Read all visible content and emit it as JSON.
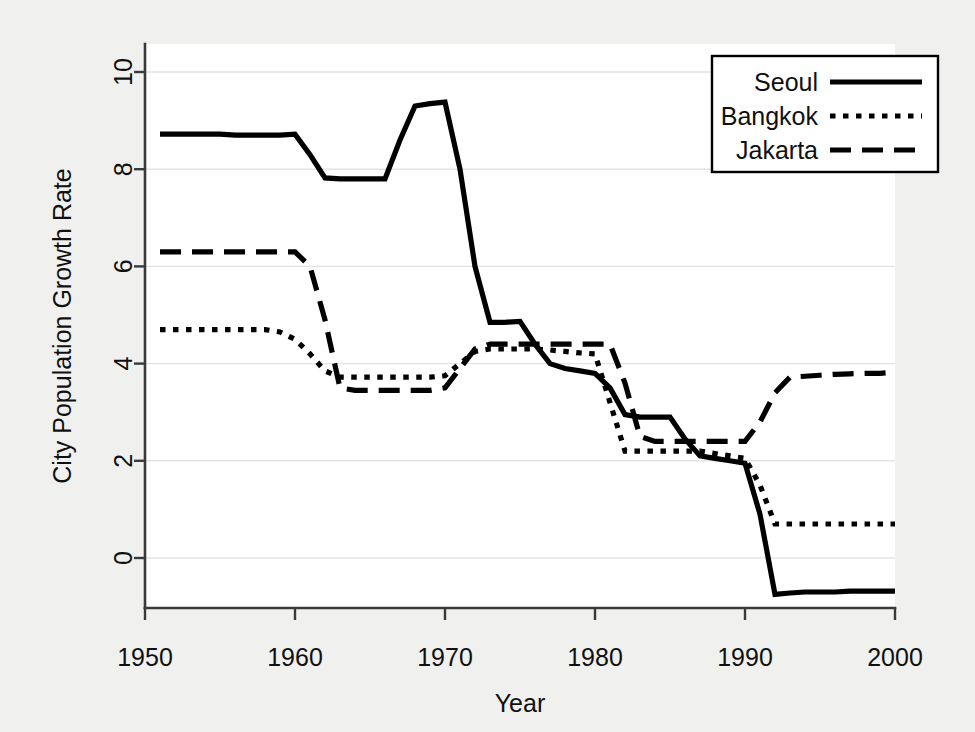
{
  "chart_data": {
    "type": "line",
    "title": "",
    "xlabel": "Year",
    "ylabel": "City Population Growth Rate",
    "xlim": [
      1950,
      2000
    ],
    "ylim": [
      -1.1,
      10.4
    ],
    "xticks": [
      1950,
      1960,
      1970,
      1980,
      1990,
      2000
    ],
    "xtick_labels": [
      "1950",
      "1960",
      "1970",
      "1980",
      "1990",
      "2000"
    ],
    "yticks": [
      0,
      2,
      4,
      6,
      8,
      10
    ],
    "ytick_labels": [
      "0",
      "2",
      "4",
      "6",
      "8",
      "10"
    ],
    "grid": "horizontal",
    "legend_position": "top-right",
    "legend_entries": [
      "Seoul",
      "Bangkok",
      "Jakarta"
    ],
    "x": [
      1951,
      1952,
      1953,
      1954,
      1955,
      1956,
      1957,
      1958,
      1959,
      1960,
      1961,
      1962,
      1963,
      1964,
      1965,
      1966,
      1967,
      1968,
      1969,
      1970,
      1971,
      1972,
      1973,
      1974,
      1975,
      1976,
      1977,
      1978,
      1979,
      1980,
      1981,
      1982,
      1983,
      1984,
      1985,
      1986,
      1987,
      1988,
      1989,
      1990,
      1991,
      1992,
      1993,
      1994,
      1995,
      1996,
      1997,
      1998,
      1999,
      2000
    ],
    "series": [
      {
        "name": "Seoul",
        "style": "solid",
        "values": [
          8.72,
          8.72,
          8.72,
          8.72,
          8.72,
          8.7,
          8.7,
          8.7,
          8.7,
          8.72,
          8.3,
          7.82,
          7.8,
          7.8,
          7.8,
          7.8,
          8.6,
          9.3,
          9.35,
          9.38,
          8.0,
          6.0,
          4.85,
          4.85,
          4.87,
          4.4,
          4.0,
          3.9,
          3.85,
          3.8,
          3.5,
          2.95,
          2.9,
          2.9,
          2.9,
          2.45,
          2.1,
          2.05,
          2.0,
          1.95,
          0.9,
          -0.75,
          -0.72,
          -0.7,
          -0.7,
          -0.7,
          -0.68,
          -0.68,
          -0.68,
          -0.68
        ]
      },
      {
        "name": "Bangkok",
        "style": "dotted",
        "values": [
          4.7,
          4.7,
          4.7,
          4.7,
          4.7,
          4.7,
          4.7,
          4.7,
          4.65,
          4.5,
          4.2,
          3.85,
          3.72,
          3.72,
          3.72,
          3.72,
          3.72,
          3.72,
          3.72,
          3.75,
          4.0,
          4.25,
          4.3,
          4.3,
          4.3,
          4.3,
          4.28,
          4.25,
          4.22,
          4.2,
          3.2,
          2.2,
          2.2,
          2.2,
          2.2,
          2.2,
          2.2,
          2.15,
          2.1,
          2.05,
          1.5,
          0.7,
          0.7,
          0.7,
          0.7,
          0.7,
          0.7,
          0.7,
          0.7,
          0.7
        ]
      },
      {
        "name": "Jakarta",
        "style": "dashed",
        "values": [
          6.3,
          6.3,
          6.3,
          6.3,
          6.3,
          6.3,
          6.3,
          6.3,
          6.3,
          6.3,
          6.0,
          4.9,
          3.5,
          3.45,
          3.45,
          3.45,
          3.45,
          3.45,
          3.45,
          3.5,
          3.9,
          4.3,
          4.4,
          4.4,
          4.4,
          4.4,
          4.4,
          4.4,
          4.4,
          4.4,
          4.4,
          3.6,
          2.5,
          2.4,
          2.4,
          2.4,
          2.4,
          2.4,
          2.4,
          2.4,
          2.8,
          3.4,
          3.72,
          3.74,
          3.76,
          3.78,
          3.79,
          3.8,
          3.8,
          3.82
        ]
      }
    ]
  }
}
